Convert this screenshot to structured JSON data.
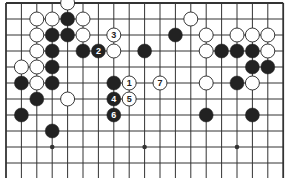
{
  "diagram": {
    "type": "go-board",
    "board_size": 19,
    "visible_rows": 11,
    "partial": "top portion of board; lines extend below bottom edge",
    "colors": {
      "background": "#ffffff",
      "line": "#333333",
      "black_stone": "#222222",
      "white_stone": "#ffffff",
      "stone_outline": "#222222",
      "black_label": "#ffffff",
      "white_label": "#222222"
    },
    "star_points": [
      {
        "col": 3,
        "row": 9
      },
      {
        "col": 9,
        "row": 9
      },
      {
        "col": 15,
        "row": 9
      }
    ],
    "stones": [
      {
        "col": 4,
        "row": 0,
        "color": "white",
        "label": ""
      },
      {
        "col": 2,
        "row": 1,
        "color": "white",
        "label": ""
      },
      {
        "col": 3,
        "row": 1,
        "color": "white",
        "label": ""
      },
      {
        "col": 4,
        "row": 1,
        "color": "black",
        "label": ""
      },
      {
        "col": 5,
        "row": 1,
        "color": "white",
        "label": ""
      },
      {
        "col": 12,
        "row": 1,
        "color": "white",
        "label": ""
      },
      {
        "col": 2,
        "row": 2,
        "color": "white",
        "label": ""
      },
      {
        "col": 3,
        "row": 2,
        "color": "black",
        "label": ""
      },
      {
        "col": 4,
        "row": 2,
        "color": "black",
        "label": ""
      },
      {
        "col": 5,
        "row": 2,
        "color": "white",
        "label": ""
      },
      {
        "col": 7,
        "row": 2,
        "color": "white",
        "label": "3"
      },
      {
        "col": 11,
        "row": 2,
        "color": "black",
        "label": ""
      },
      {
        "col": 13,
        "row": 2,
        "color": "white",
        "label": ""
      },
      {
        "col": 15,
        "row": 2,
        "color": "white",
        "label": ""
      },
      {
        "col": 16,
        "row": 2,
        "color": "white",
        "label": ""
      },
      {
        "col": 17,
        "row": 2,
        "color": "white",
        "label": ""
      },
      {
        "col": 2,
        "row": 3,
        "color": "white",
        "label": ""
      },
      {
        "col": 3,
        "row": 3,
        "color": "black",
        "label": ""
      },
      {
        "col": 5,
        "row": 3,
        "color": "black",
        "label": ""
      },
      {
        "col": 6,
        "row": 3,
        "color": "black",
        "label": "2"
      },
      {
        "col": 7,
        "row": 3,
        "color": "white",
        "label": ""
      },
      {
        "col": 9,
        "row": 3,
        "color": "black",
        "label": ""
      },
      {
        "col": 13,
        "row": 3,
        "color": "white",
        "label": ""
      },
      {
        "col": 14,
        "row": 3,
        "color": "black",
        "label": ""
      },
      {
        "col": 15,
        "row": 3,
        "color": "black",
        "label": ""
      },
      {
        "col": 16,
        "row": 3,
        "color": "black",
        "label": ""
      },
      {
        "col": 17,
        "row": 3,
        "color": "white",
        "label": ""
      },
      {
        "col": 1,
        "row": 4,
        "color": "white",
        "label": ""
      },
      {
        "col": 2,
        "row": 4,
        "color": "white",
        "label": ""
      },
      {
        "col": 3,
        "row": 4,
        "color": "black",
        "label": ""
      },
      {
        "col": 16,
        "row": 4,
        "color": "black",
        "label": ""
      },
      {
        "col": 17,
        "row": 4,
        "color": "black",
        "label": ""
      },
      {
        "col": 1,
        "row": 5,
        "color": "black",
        "label": ""
      },
      {
        "col": 2,
        "row": 5,
        "color": "white",
        "label": ""
      },
      {
        "col": 3,
        "row": 5,
        "color": "black",
        "label": ""
      },
      {
        "col": 7,
        "row": 5,
        "color": "black",
        "label": ""
      },
      {
        "col": 8,
        "row": 5,
        "color": "white",
        "label": "1"
      },
      {
        "col": 10,
        "row": 5,
        "color": "white",
        "label": "7"
      },
      {
        "col": 13,
        "row": 5,
        "color": "white",
        "label": ""
      },
      {
        "col": 15,
        "row": 5,
        "color": "black",
        "label": ""
      },
      {
        "col": 16,
        "row": 5,
        "color": "white",
        "label": ""
      },
      {
        "col": 2,
        "row": 6,
        "color": "black",
        "label": ""
      },
      {
        "col": 4,
        "row": 6,
        "color": "white",
        "label": ""
      },
      {
        "col": 7,
        "row": 6,
        "color": "black",
        "label": "4"
      },
      {
        "col": 8,
        "row": 6,
        "color": "white",
        "label": "5"
      },
      {
        "col": 1,
        "row": 7,
        "color": "black",
        "label": ""
      },
      {
        "col": 7,
        "row": 7,
        "color": "black",
        "label": "6"
      },
      {
        "col": 13,
        "row": 7,
        "color": "black",
        "label": ""
      },
      {
        "col": 16,
        "row": 7,
        "color": "black",
        "label": ""
      },
      {
        "col": 3,
        "row": 8,
        "color": "black",
        "label": ""
      }
    ]
  }
}
